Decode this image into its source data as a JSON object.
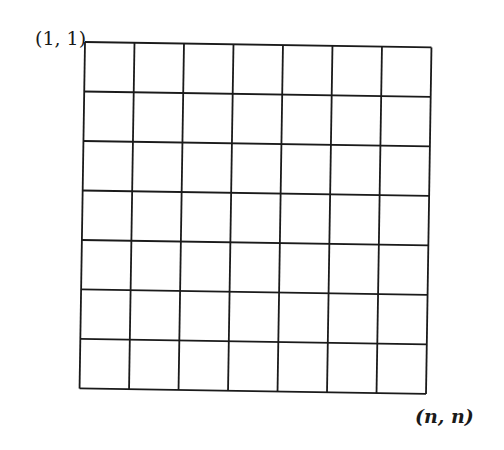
{
  "diagram": {
    "type": "grid",
    "rows": 7,
    "cols": 7,
    "line_color": "#1a1a1a",
    "background": "#ffffff",
    "corner_labels": {
      "top_left": "(1, 1)",
      "bottom_right": "(n, n)"
    }
  }
}
